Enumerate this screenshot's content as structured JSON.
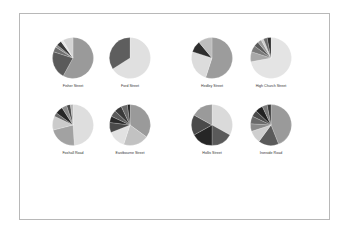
{
  "chart_data": [
    {
      "type": "pie",
      "title": "Fisher Street",
      "center": [
        73,
        58
      ],
      "slices": [
        {
          "value": 58,
          "color": "#9a9a9a"
        },
        {
          "value": 22,
          "color": "#5a5a5a"
        },
        {
          "value": 4,
          "color": "#6e6e6e"
        },
        {
          "value": 2,
          "color": "#8a8a8a"
        },
        {
          "value": 4,
          "color": "#3a3a3a"
        },
        {
          "value": 2,
          "color": "#e6e6e6"
        },
        {
          "value": 8,
          "color": "#d4d4d4"
        }
      ]
    },
    {
      "type": "pie",
      "title": "Ford Street",
      "center": [
        130,
        58
      ],
      "slices": [
        {
          "value": 66,
          "color": "#e0e0e0"
        },
        {
          "value": 34,
          "color": "#5e5e5e"
        }
      ]
    },
    {
      "type": "pie",
      "title": "Hedley Street",
      "center": [
        212,
        58
      ],
      "slices": [
        {
          "value": 55,
          "color": "#9c9c9c"
        },
        {
          "value": 25,
          "color": "#dcdcdc"
        },
        {
          "value": 9,
          "color": "#2e2e2e"
        },
        {
          "value": 11,
          "color": "#bdbdbd"
        }
      ]
    },
    {
      "type": "pie",
      "title": "High Church Street",
      "center": [
        271,
        58
      ],
      "slices": [
        {
          "value": 72,
          "color": "#e4e4e4"
        },
        {
          "value": 8,
          "color": "#a8a8a8"
        },
        {
          "value": 5,
          "color": "#7a7a7a"
        },
        {
          "value": 4,
          "color": "#5a5a5a"
        },
        {
          "value": 3,
          "color": "#9a9a9a"
        },
        {
          "value": 2,
          "color": "#cfcfcf"
        },
        {
          "value": 3,
          "color": "#6a6a6a"
        },
        {
          "value": 3,
          "color": "#2e2e2e"
        }
      ]
    },
    {
      "type": "pie",
      "title": "Foxhall Road",
      "center": [
        73,
        125
      ],
      "slices": [
        {
          "value": 49,
          "color": "#dedede"
        },
        {
          "value": 22,
          "color": "#a2a2a2"
        },
        {
          "value": 11,
          "color": "#cbcbcb"
        },
        {
          "value": 3,
          "color": "#6a6a6a"
        },
        {
          "value": 6,
          "color": "#262626"
        },
        {
          "value": 4,
          "color": "#8a8a8a"
        },
        {
          "value": 3,
          "color": "#4a4a4a"
        },
        {
          "value": 2,
          "color": "#b5b5b5"
        }
      ]
    },
    {
      "type": "pie",
      "title": "Eastbourne Street",
      "center": [
        130,
        125
      ],
      "slices": [
        {
          "value": 35,
          "color": "#9a9a9a"
        },
        {
          "value": 20,
          "color": "#c2c2c2"
        },
        {
          "value": 14,
          "color": "#e2e2e2"
        },
        {
          "value": 8,
          "color": "#4a4a4a"
        },
        {
          "value": 5,
          "color": "#2a2a2a"
        },
        {
          "value": 5,
          "color": "#5a5a5a"
        },
        {
          "value": 6,
          "color": "#3a3a3a"
        },
        {
          "value": 5,
          "color": "#6a6a6a"
        },
        {
          "value": 2,
          "color": "#1e1e1e"
        }
      ]
    },
    {
      "type": "pie",
      "title": "Hollis Street",
      "center": [
        212,
        125
      ],
      "slices": [
        {
          "value": 33,
          "color": "#dadada"
        },
        {
          "value": 17,
          "color": "#5a5a5a"
        },
        {
          "value": 17,
          "color": "#262626"
        },
        {
          "value": 16,
          "color": "#4a4a4a"
        },
        {
          "value": 17,
          "color": "#9a9a9a"
        }
      ]
    },
    {
      "type": "pie",
      "title": "Ironside Road",
      "center": [
        271,
        125
      ],
      "slices": [
        {
          "value": 44,
          "color": "#9a9a9a"
        },
        {
          "value": 16,
          "color": "#5a5a5a"
        },
        {
          "value": 10,
          "color": "#cfcfcf"
        },
        {
          "value": 6,
          "color": "#8a8a8a"
        },
        {
          "value": 6,
          "color": "#6a6a6a"
        },
        {
          "value": 5,
          "color": "#4a4a4a"
        },
        {
          "value": 6,
          "color": "#222222"
        },
        {
          "value": 4,
          "color": "#7a7a7a"
        },
        {
          "value": 3,
          "color": "#3a3a3a"
        }
      ]
    }
  ],
  "labels": {
    "p0": "Fisher Street",
    "p1": "Ford Street",
    "p2": "Hedley Street",
    "p3": "High Church Street",
    "p4": "Foxhall Road",
    "p5": "Eastbourne Street",
    "p6": "Hollis Street",
    "p7": "Ironside Road"
  }
}
